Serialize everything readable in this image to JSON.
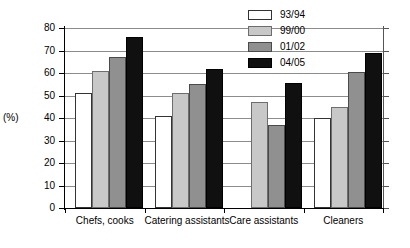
{
  "chart_data": {
    "type": "bar",
    "title": "",
    "subtitle": "",
    "xlabel": "",
    "ylabel": "(%)",
    "ylim": [
      0,
      80
    ],
    "ytick_step": 10,
    "yticks": [
      "80",
      "70",
      "60",
      "50",
      "40",
      "30",
      "20",
      "10",
      "0"
    ],
    "grid": true,
    "legend_position": "top-right",
    "categories": [
      "Chefs, cooks",
      "Catering assistants",
      "Care assistants",
      "Cleaners"
    ],
    "series": [
      {
        "name": "93/94",
        "color": "#ffffff",
        "values": [
          51,
          41,
          null,
          40
        ]
      },
      {
        "name": "99/00",
        "color": "#c8c8c8",
        "values": [
          61,
          51,
          47,
          45
        ]
      },
      {
        "name": "01/02",
        "color": "#909090",
        "values": [
          67,
          55,
          37,
          60.5
        ]
      },
      {
        "name": "04/05",
        "color": "#101010",
        "values": [
          76,
          62,
          55.5,
          69
        ]
      }
    ]
  },
  "legend": {
    "items": [
      {
        "label": "93/94"
      },
      {
        "label": "99/00"
      },
      {
        "label": "01/02"
      },
      {
        "label": "04/05"
      }
    ]
  },
  "axes": {
    "y_unit_label": "(%)"
  }
}
